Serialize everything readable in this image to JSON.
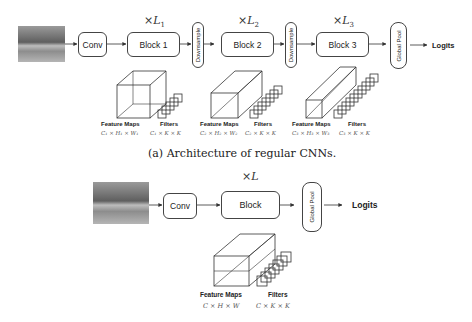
{
  "figure_a": {
    "input_image": "input-photo",
    "conv_label": "Conv",
    "blocks": [
      {
        "label": "Block 1",
        "multiplier": "×L",
        "sub": "1"
      },
      {
        "label": "Block 2",
        "multiplier": "×L",
        "sub": "2"
      },
      {
        "label": "Block 3",
        "multiplier": "×L",
        "sub": "3"
      }
    ],
    "downsample_label": "Downsample",
    "global_pool_label": "Global Pool",
    "logits_label": "Logits",
    "stages": [
      {
        "feature_maps_label": "Feature Maps",
        "feature_maps_dims": "C₁ × H₁ × W₁",
        "filters_label": "Filters",
        "filters_dims": "C₁ × K × K"
      },
      {
        "feature_maps_label": "Feature Maps",
        "feature_maps_dims": "C₂ × H₂ × W₂",
        "filters_label": "Filters",
        "filters_dims": "C₂ × K × K"
      },
      {
        "feature_maps_label": "Feature Maps",
        "feature_maps_dims": "C₃ × H₃ × W₃",
        "filters_label": "Filters",
        "filters_dims": "C₃ × K × K"
      }
    ],
    "caption": "(a) Architecture of regular CNNs."
  },
  "figure_b": {
    "conv_label": "Conv",
    "block_label": "Block",
    "multiplier": "×L",
    "global_pool_label": "Global Pool",
    "logits_label": "Logits",
    "feature_maps_label": "Feature Maps",
    "feature_maps_dims": "C × H × W",
    "filters_label": "Filters",
    "filters_dims": "C × K × K"
  }
}
